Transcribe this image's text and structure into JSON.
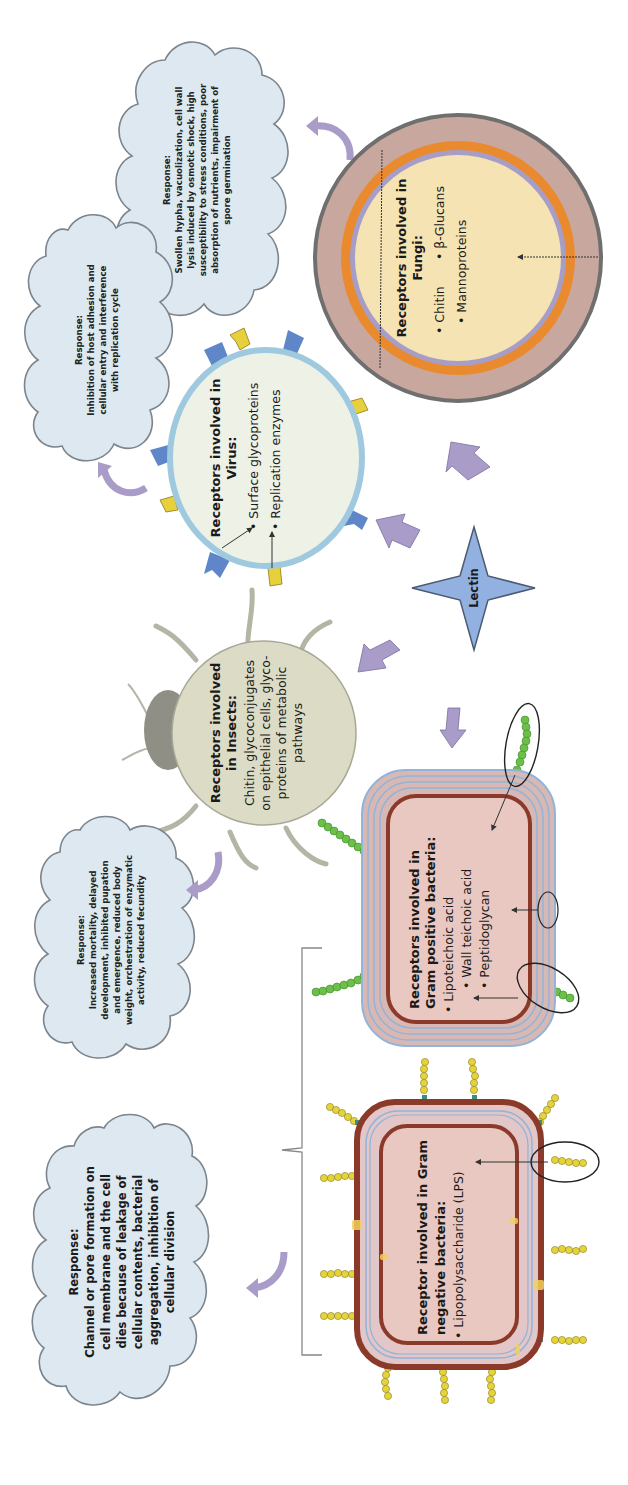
{
  "diagram": {
    "center": {
      "label": "Lectin",
      "color": "#92b0e0"
    },
    "fungi": {
      "title_line1": "Receptors involved in",
      "title_line2": "Fungi:",
      "items": [
        "Chitin",
        "β-Glucans",
        "Mannoproteins"
      ],
      "response": {
        "title": "Response:",
        "lines": [
          "Swollen hypha, vacuolization, cell wall",
          "lysis induced by osmotic shock, high",
          "susceptibility to stress conditions, poor",
          "absorption of nutrients, impairment of",
          "spore germination"
        ]
      },
      "colors": {
        "outer": "#c8a89e",
        "orange": "#ea8a2e",
        "lavender": "#a79ec8",
        "core": "#f5e3b3",
        "rim": "#6f6f6f"
      }
    },
    "virus": {
      "title_line1": "Receptors involved in",
      "title_line2": "Virus:",
      "items": [
        "Surface glycoproteins",
        "Replication enzymes"
      ],
      "response": {
        "title": "Response:",
        "lines": [
          "Inhibition of host adhesion and",
          "cellular entry and interference",
          "with replication cycle"
        ]
      },
      "colors": {
        "fill": "#eef1e6",
        "rim": "#9fc9de",
        "spike_blue": "#5f86c8",
        "spike_yellow": "#e8cf3c"
      }
    },
    "insects": {
      "title_line1": "Receptors involved",
      "title_line2": "in Insects:",
      "body_lines": [
        "Chitin, glycoconjugates",
        "on epithelial cells, glyco-",
        "proteins of metabolic",
        "pathways"
      ],
      "response": {
        "title": "Response:",
        "lines": [
          "Increased mortality, delayed",
          "development, inhibited pupation",
          "and emergence, reduced body",
          "weight, orchestration of enzymatic",
          "activity, reduced fecundity"
        ]
      },
      "colors": {
        "body": "#dcdcc6",
        "head": "#8f8f86",
        "legs": "#b5b5a6"
      }
    },
    "gram_positive": {
      "title_line1": "Receptors involved in",
      "title_line2": "Gram positive bacteria:",
      "items": [
        "Lipoteichoic acid",
        "Wall teichoic acid",
        "Peptidoglycan"
      ],
      "colors": {
        "wall": "#d8b8b4",
        "lines": "#92b4d8",
        "membrane": "#8b3a2a",
        "cyto": "#e8c8c0",
        "chain": "#6cc04a"
      }
    },
    "gram_negative": {
      "title_line1": "Receptor involved in Gram",
      "title_line2": "negative bacteria:",
      "items": [
        "Lipopolysaccharide (LPS)"
      ],
      "colors": {
        "membrane": "#8b3a2a",
        "periplasm": "#e2c6c8",
        "lines": "#92b4d8",
        "cyto": "#e8c8c0",
        "lps": "#e4d43a",
        "anchor": "#3d8c86"
      }
    },
    "bacteria_response": {
      "title": "Response:",
      "lines": [
        "Channel or pore formation on",
        "cell membrane and the cell",
        "dies because of leakage of",
        "cellular contents, bacterial",
        "aggregation, inhibition of",
        "cellular division"
      ]
    },
    "arrow_color": "#a99cc8"
  }
}
